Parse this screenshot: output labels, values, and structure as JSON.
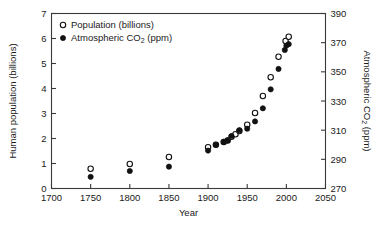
{
  "chart_data": {
    "type": "scatter",
    "title": "",
    "xlabel": "Year",
    "ylabel": "Human population (billions)",
    "y2label": "Atmospheric CO2 (ppm)",
    "ylabel_parts": {
      "before": "Human population (billions)"
    },
    "y2label_parts": {
      "pre": "Atmospheric CO",
      "sub": "2",
      "post": " (ppm)"
    },
    "xlim": [
      1700,
      2050
    ],
    "ylim": [
      0,
      7
    ],
    "y2lim": [
      270,
      390
    ],
    "xticks": [
      1700,
      1750,
      1800,
      1850,
      1900,
      1950,
      2000,
      2050
    ],
    "yticks": [
      0,
      1,
      2,
      3,
      4,
      5,
      6,
      7
    ],
    "y2ticks": [
      270,
      290,
      310,
      330,
      350,
      370,
      390
    ],
    "grid": false,
    "legend_position": "top-left",
    "series": [
      {
        "name": "Population (billions)",
        "marker": "open-circle",
        "axis": "left",
        "color": "#111111",
        "x": [
          1750,
          1800,
          1850,
          1900,
          1910,
          1920,
          1925,
          1930,
          1935,
          1940,
          1950,
          1960,
          1970,
          1980,
          1990,
          1999,
          2003
        ],
        "values": [
          0.79,
          0.98,
          1.26,
          1.65,
          1.75,
          1.86,
          1.92,
          2.07,
          2.17,
          2.3,
          2.55,
          3.02,
          3.7,
          4.45,
          5.27,
          5.9,
          6.07
        ]
      },
      {
        "name": "Atmospheric CO2 (ppm)",
        "marker": "filled-circle",
        "axis": "right",
        "color": "#111111",
        "x": [
          1750,
          1800,
          1850,
          1900,
          1910,
          1920,
          1925,
          1930,
          1940,
          1950,
          1960,
          1970,
          1980,
          1990,
          1998,
          2000,
          2003
        ],
        "values": [
          278,
          282,
          285,
          296,
          300,
          302,
          303,
          306,
          310,
          311,
          316,
          325,
          338,
          352,
          365,
          368,
          369
        ]
      }
    ]
  },
  "legend": {
    "items": [
      {
        "marker": "open-circle",
        "label": "Population (billions)"
      },
      {
        "marker": "filled-circle",
        "pre": "Atmospheric CO",
        "sub": "2",
        "post": " (ppm)"
      }
    ]
  },
  "axes": {
    "x_title": "Year",
    "y_title": "Human population (billions)",
    "y2_pre": "Atmospheric CO",
    "y2_sub": "2",
    "y2_post": " (ppm)",
    "x_tick_labels": [
      "1700",
      "1750",
      "1800",
      "1850",
      "1900",
      "1950",
      "2000",
      "2050"
    ],
    "y_tick_labels": [
      "0",
      "1",
      "2",
      "3",
      "4",
      "5",
      "6",
      "7"
    ],
    "y2_tick_labels": [
      "270",
      "290",
      "310",
      "330",
      "350",
      "370",
      "390"
    ]
  }
}
